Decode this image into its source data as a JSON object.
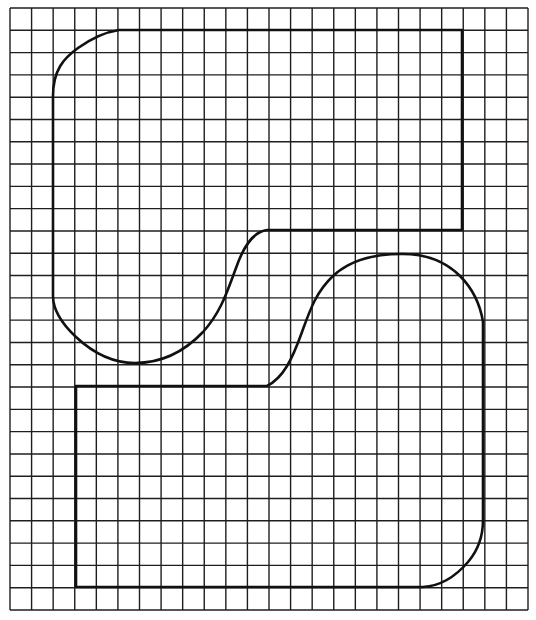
{
  "figure": {
    "type": "grid-drawing",
    "background": "#ffffff",
    "grid": {
      "columns": 24,
      "rows": 27,
      "x_start": 10,
      "x_end": 528,
      "y_start": 8,
      "y_end": 610,
      "line_color": "#1e1e1e"
    },
    "shapes": [
      {
        "name": "upper-shape",
        "description": "Rounded shape with rounded top-left corner, straight top and right edges, a step on the lower right and an S-curve flowing into a rounded bottom-left",
        "stroke": "#111111"
      },
      {
        "name": "lower-shape",
        "description": "Rounded shape with straight left and bottom edges, a rounded bottom-right corner, an arched top-right and an S-curve flowing down into the top-left edge",
        "stroke": "#111111"
      }
    ]
  }
}
